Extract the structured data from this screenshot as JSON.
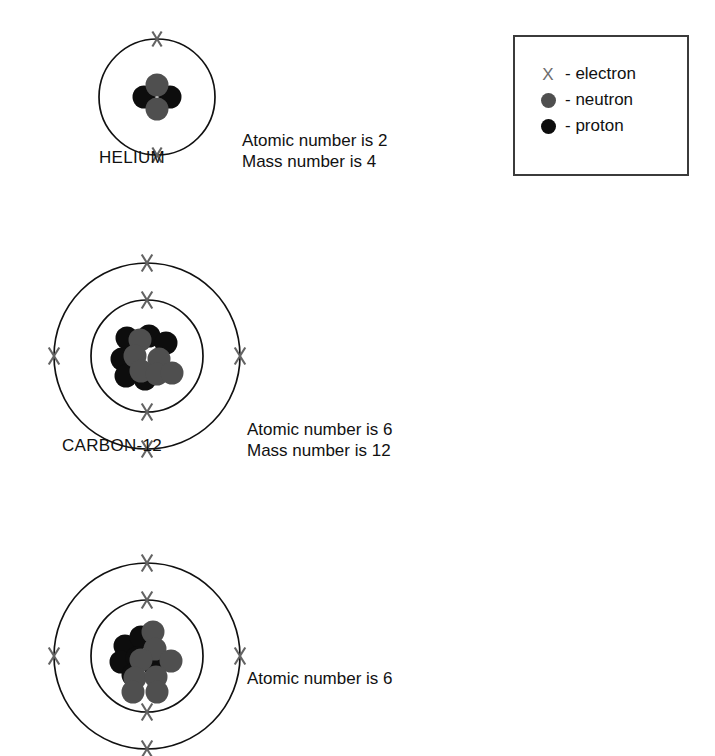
{
  "legend": {
    "name": "particle-key",
    "items": [
      {
        "symbol": "X",
        "symbol_kind": "x-mark",
        "separator": "- ",
        "label": "electron",
        "color": "#6d6d6d"
      },
      {
        "symbol": "filled-circle",
        "symbol_kind": "gray-dot",
        "separator": "- ",
        "label": "neutron",
        "color": "#4f4f4f"
      },
      {
        "symbol": "filled-circle",
        "symbol_kind": "black-dot",
        "separator": "- ",
        "label": "proton",
        "color": "#0d0d0d"
      }
    ]
  },
  "atoms": [
    {
      "id": "helium",
      "label": "HELIUM",
      "facts": {
        "atomic_number_line": "Atomic number is 2",
        "mass_number_line": "Mass number is 4"
      },
      "atomic_number": 2,
      "mass_number": 4,
      "protons": 2,
      "neutrons": 2,
      "shells": [
        {
          "index": 1,
          "electrons": 2,
          "electron_angles_deg": [
            90,
            270
          ]
        }
      ],
      "nucleus_particles": [
        {
          "type": "proton",
          "dx": -13,
          "dy": 0
        },
        {
          "type": "proton",
          "dx": 13,
          "dy": 0
        },
        {
          "type": "neutron",
          "dx": 0,
          "dy": -12
        },
        {
          "type": "neutron",
          "dx": 0,
          "dy": 12
        }
      ]
    },
    {
      "id": "carbon-12",
      "label": "CARBON-12",
      "facts": {
        "atomic_number_line": "Atomic number is 6",
        "mass_number_line": "Mass number is 12"
      },
      "atomic_number": 6,
      "mass_number": 12,
      "protons": 6,
      "neutrons": 6,
      "shells": [
        {
          "index": 1,
          "electrons": 2,
          "electron_angles_deg": [
            90,
            270
          ]
        },
        {
          "index": 2,
          "electrons": 4,
          "electron_angles_deg": [
            90,
            0,
            270,
            180
          ]
        }
      ],
      "nucleus_particles": [
        {
          "type": "proton",
          "dx": -20,
          "dy": -18
        },
        {
          "type": "proton",
          "dx": 2,
          "dy": -20
        },
        {
          "type": "proton",
          "dx": 19,
          "dy": -13
        },
        {
          "type": "proton",
          "dx": -25,
          "dy": 3
        },
        {
          "type": "proton",
          "dx": -21,
          "dy": 20
        },
        {
          "type": "proton",
          "dx": -2,
          "dy": 23
        },
        {
          "type": "neutron",
          "dx": -7,
          "dy": -16
        },
        {
          "type": "neutron",
          "dx": -12,
          "dy": 0
        },
        {
          "type": "neutron",
          "dx": 12,
          "dy": 3
        },
        {
          "type": "neutron",
          "dx": -6,
          "dy": 15
        },
        {
          "type": "neutron",
          "dx": 10,
          "dy": 18
        },
        {
          "type": "neutron",
          "dx": 25,
          "dy": 17
        }
      ]
    },
    {
      "id": "carbon-14",
      "label": "",
      "facts": {
        "atomic_number_line": "Atomic number is 6",
        "mass_number_line": ""
      },
      "atomic_number": 6,
      "mass_number": 14,
      "protons": 6,
      "neutrons": 8,
      "shells": [
        {
          "index": 1,
          "electrons": 2,
          "electron_angles_deg": [
            90,
            270
          ]
        },
        {
          "index": 2,
          "electrons": 4,
          "electron_angles_deg": [
            90,
            0,
            270,
            180
          ]
        }
      ],
      "nucleus_particles": [
        {
          "type": "proton",
          "dx": -22,
          "dy": -10
        },
        {
          "type": "proton",
          "dx": -6,
          "dy": -19
        },
        {
          "type": "proton",
          "dx": -26,
          "dy": 6
        },
        {
          "type": "proton",
          "dx": -10,
          "dy": 2
        },
        {
          "type": "proton",
          "dx": 8,
          "dy": 10
        },
        {
          "type": "proton",
          "dx": -14,
          "dy": 19
        },
        {
          "type": "neutron",
          "dx": 6,
          "dy": -24
        },
        {
          "type": "neutron",
          "dx": 8,
          "dy": -7
        },
        {
          "type": "neutron",
          "dx": -6,
          "dy": 4
        },
        {
          "type": "neutron",
          "dx": 24,
          "dy": 5
        },
        {
          "type": "neutron",
          "dx": -12,
          "dy": 22
        },
        {
          "type": "neutron",
          "dx": 9,
          "dy": 21
        },
        {
          "type": "neutron",
          "dx": -14,
          "dy": 36
        },
        {
          "type": "neutron",
          "dx": 10,
          "dy": 36
        }
      ]
    }
  ]
}
